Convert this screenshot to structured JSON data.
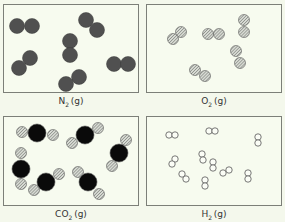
{
  "colors": {
    "background": "#f4f8ec",
    "panel_border": "#7c7f78",
    "nitrogen": "#555555",
    "oxygen_hatch": "#8a8c88",
    "carbon": "#0a0a0a",
    "hydrogen_stroke": "#555555"
  },
  "panels": [
    {
      "id": "n2",
      "formula": "N",
      "subscript": "2",
      "state": "(g)",
      "legend_atom": "nitrogen"
    },
    {
      "id": "o2",
      "formula": "O",
      "subscript": "2",
      "state": "(g)",
      "legend_atom": "oxygen"
    },
    {
      "id": "co2",
      "formula": "CO",
      "subscript": "2",
      "state": "(g)",
      "legend_atom": "carbon+oxygen"
    },
    {
      "id": "h2",
      "formula": "H",
      "subscript": "2",
      "state": "(g)",
      "legend_atom": "hydrogen"
    }
  ],
  "molecule_counts": {
    "n2": 7,
    "o2": 6,
    "co2": 6,
    "h2": 12
  }
}
